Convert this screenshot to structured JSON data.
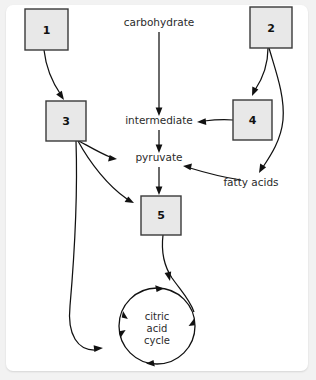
{
  "page": {
    "background_color": "#f2f2f2",
    "card_color": "#ffffff"
  },
  "diagram": {
    "type": "flow-diagram",
    "box_fill": "#e8e8e8",
    "box_stroke": "#3a3a3a",
    "line_color": "#111111",
    "boxes": [
      {
        "id": "box-1",
        "label": "1",
        "x": 25,
        "y": 9,
        "w": 43,
        "h": 41
      },
      {
        "id": "box-2",
        "label": "2",
        "x": 250,
        "y": 7,
        "w": 42,
        "h": 41
      },
      {
        "id": "box-3",
        "label": "3",
        "x": 46,
        "y": 101,
        "w": 40,
        "h": 40
      },
      {
        "id": "box-4",
        "label": "4",
        "x": 233,
        "y": 100,
        "w": 39,
        "h": 40
      },
      {
        "id": "box-5",
        "label": "5",
        "x": 141,
        "y": 196,
        "w": 40,
        "h": 39
      }
    ],
    "metabolites": [
      {
        "id": "carbohydrate",
        "label": "carbohydrate",
        "x": 159,
        "y": 26
      },
      {
        "id": "intermediate",
        "label": "intermediate",
        "x": 159,
        "y": 124
      },
      {
        "id": "pyruvate",
        "label": "pyruvate",
        "x": 159,
        "y": 161
      },
      {
        "id": "fatty-acids",
        "label": "fatty acids",
        "x": 251,
        "y": 186
      }
    ],
    "cycle": {
      "id": "citric-acid-cycle",
      "lines": [
        "citric",
        "acid",
        "cycle"
      ],
      "cx": 157,
      "cy": 326,
      "r": 38
    }
  }
}
